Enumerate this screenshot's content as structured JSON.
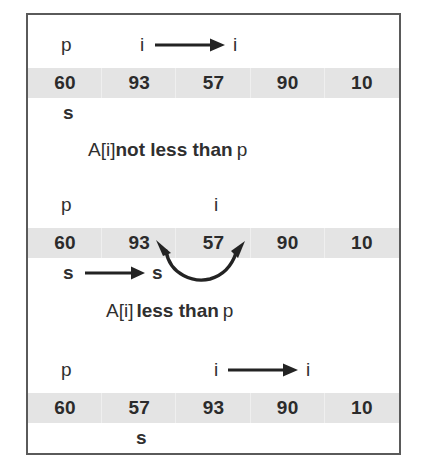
{
  "figure": {
    "border_color": "#5a5a5a",
    "band_color": "#e4e4e4",
    "ink_color": "#2b2b2b"
  },
  "sections": [
    {
      "id": "step-1",
      "pivot_label": "p",
      "index_label_from": "i",
      "index_label_to": "i",
      "index_arrow": "right-arrow",
      "array": [
        "60",
        "93",
        "57",
        "90",
        "10"
      ],
      "s_label": "s",
      "caption_plain_prefix": "A[i]",
      "caption_bold": "not less than",
      "caption_plain_suffix": "p"
    },
    {
      "id": "step-2",
      "pivot_label": "p",
      "index_label_from": "i",
      "index_label_to": "",
      "index_arrow": "none",
      "array": [
        "60",
        "93",
        "57",
        "90",
        "10"
      ],
      "s_label_from": "s",
      "s_label_to": "s",
      "s_arrow": "right-arrow",
      "swap_arrow": "double-headed-curved-arrow",
      "caption_plain_prefix": "A[i]",
      "caption_bold": "less than",
      "caption_plain_suffix": "p"
    },
    {
      "id": "step-3",
      "pivot_label": "p",
      "index_label_from": "i",
      "index_label_to": "i",
      "index_arrow": "right-arrow",
      "array": [
        "60",
        "57",
        "93",
        "90",
        "10"
      ],
      "s_label": "s",
      "caption_plain_prefix": "",
      "caption_bold": "",
      "caption_plain_suffix": ""
    }
  ]
}
